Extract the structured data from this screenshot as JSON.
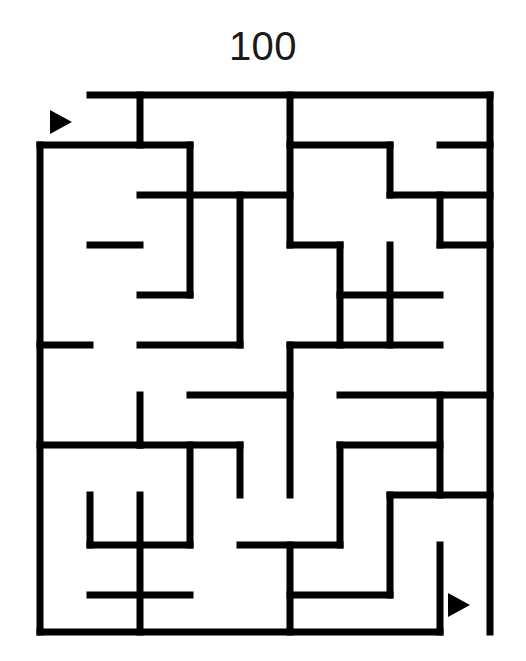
{
  "title": "100",
  "maze": {
    "type": "rectangular-grid-maze",
    "columns": 9,
    "rows": 11,
    "cell_size": 50,
    "origin_x": 40,
    "origin_y": 95,
    "wall_color": "#000000",
    "wall_thickness": 7,
    "background_color": "#ffffff",
    "entrance": {
      "label": "entrance-arrow",
      "side": "top-left",
      "x": 50,
      "y": 110,
      "direction": "right"
    },
    "exit": {
      "label": "exit-arrow",
      "side": "bottom-right",
      "x": 448,
      "y": 593,
      "direction": "right"
    },
    "horizontal_walls": [
      [
        90,
        95,
        490
      ],
      [
        40,
        145,
        190
      ],
      [
        290,
        145,
        390
      ],
      [
        440,
        145,
        490
      ],
      [
        140,
        195,
        290
      ],
      [
        390,
        195,
        490
      ],
      [
        90,
        245,
        140
      ],
      [
        290,
        245,
        340
      ],
      [
        440,
        245,
        490
      ],
      [
        140,
        295,
        190
      ],
      [
        340,
        295,
        440
      ],
      [
        40,
        345,
        90
      ],
      [
        140,
        345,
        240
      ],
      [
        290,
        345,
        440
      ],
      [
        190,
        395,
        290
      ],
      [
        340,
        395,
        490
      ],
      [
        40,
        445,
        140
      ],
      [
        140,
        445,
        240
      ],
      [
        340,
        445,
        440
      ],
      [
        390,
        495,
        490
      ],
      [
        90,
        545,
        190
      ],
      [
        240,
        545,
        340
      ],
      [
        90,
        595,
        190
      ],
      [
        290,
        595,
        390
      ],
      [
        40,
        632,
        440
      ]
    ],
    "vertical_walls": [
      [
        40,
        145,
        632
      ],
      [
        490,
        95,
        632
      ],
      [
        140,
        95,
        145
      ],
      [
        190,
        145,
        295
      ],
      [
        240,
        195,
        345
      ],
      [
        290,
        95,
        245
      ],
      [
        290,
        345,
        495
      ],
      [
        340,
        245,
        345
      ],
      [
        340,
        445,
        545
      ],
      [
        390,
        145,
        195
      ],
      [
        390,
        245,
        345
      ],
      [
        390,
        495,
        595
      ],
      [
        440,
        195,
        245
      ],
      [
        440,
        395,
        495
      ],
      [
        440,
        545,
        632
      ],
      [
        140,
        395,
        445
      ],
      [
        140,
        495,
        632
      ],
      [
        190,
        445,
        545
      ],
      [
        240,
        445,
        495
      ],
      [
        290,
        545,
        632
      ],
      [
        90,
        495,
        545
      ]
    ]
  },
  "colors": {
    "wall": "#000000",
    "background": "#ffffff",
    "title_text": "#1a1a1a"
  }
}
